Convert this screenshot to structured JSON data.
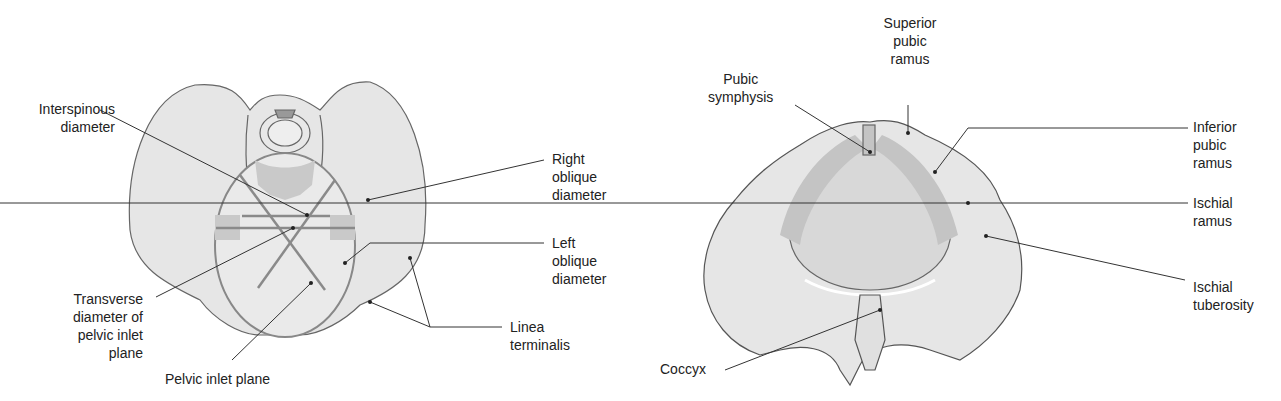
{
  "left_figure": {
    "name": "Pelvic inlet (superior view)",
    "labels": {
      "interspinous": "Interspinous\ndiameter",
      "right_oblique": "Right\noblique\ndiameter",
      "left_oblique": "Left\noblique\ndiameter",
      "transverse": "Transverse\ndiameter of\npelvic inlet\nplane",
      "inlet_plane": "Pelvic inlet plane",
      "linea": "Linea\nterminalis"
    }
  },
  "right_figure": {
    "name": "Pelvic outlet (inferior view)",
    "labels": {
      "superior_pubic": "Superior\npubic\nramus",
      "pubic_symphysis": "Pubic\nsymphysis",
      "inferior_pubic": "Inferior\npubic\nramus",
      "ischial_ramus": "Ischial\nramus",
      "ischial_tuberosity": "Ischial\ntuberosity",
      "coccyx": "Coccyx"
    }
  },
  "colors": {
    "bone": "#e4e4e4",
    "outline": "#555555",
    "shade": "#c4c4c4",
    "line": "#8a8a8a"
  }
}
